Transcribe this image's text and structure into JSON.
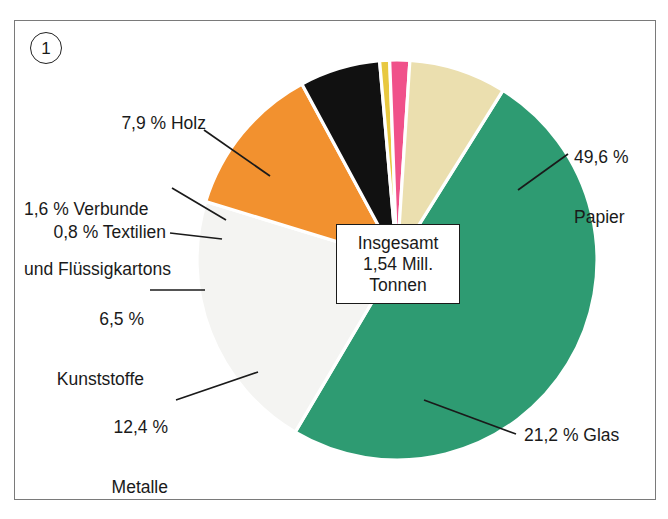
{
  "figure": {
    "marker_label": "1",
    "center_note": {
      "line1": "Insgesamt",
      "line2": "1,54 Mill.",
      "line3": "Tonnen"
    }
  },
  "colors": {
    "papier": "#2E9B72",
    "glas": "#F4F4F2",
    "metalle": "#F2912F",
    "kunststoffe": "#111111",
    "textilien": "#E8C840",
    "verbunde": "#F0518A",
    "holz": "#EBDFAF",
    "separator": "#FFFFFF",
    "leader_line": "#1A1A1A",
    "frame_border": "#7A7A7A",
    "text": "#1A1A1A"
  },
  "labels": {
    "holz": "7,9 % Holz",
    "verbunde_l1": "1,6 % Verbunde",
    "verbunde_l2": "und Flüssigkartons",
    "textilien": "0,8 % Textilien",
    "kunststoffe_l1": "6,5 %",
    "kunststoffe_l2": "Kunststoffe",
    "metalle_l1": "12,4 %",
    "metalle_l2": "Metalle",
    "papier_l1": "49,6 %",
    "papier_l2": "Papier",
    "glas": "21,2 % Glas"
  },
  "chart_data": {
    "type": "pie",
    "title": "Insgesamt 1,54 Mill. Tonnen",
    "unit": "%",
    "total_label": "1,54 Mill. Tonnen",
    "legend_position": "callout-labels",
    "categories": [
      "Papier",
      "Glas",
      "Metalle",
      "Kunststoffe",
      "Textilien",
      "Verbunde und Flüssigkartons",
      "Holz"
    ],
    "values": [
      49.6,
      21.2,
      12.4,
      6.5,
      0.8,
      1.6,
      7.9
    ],
    "slices": [
      {
        "name": "Papier",
        "value": 49.6,
        "display": "49,6 %",
        "color": "#2E9B72",
        "start_angle": -58.0,
        "end_angle": 120.6
      },
      {
        "name": "Glas",
        "value": 21.2,
        "display": "21,2 %",
        "color": "#F4F4F2",
        "start_angle": 120.6,
        "end_angle": 197.0
      },
      {
        "name": "Metalle",
        "value": 12.4,
        "display": "12,4 %",
        "color": "#F2912F",
        "start_angle": 197.0,
        "end_angle": 241.6
      },
      {
        "name": "Kunststoffe",
        "value": 6.5,
        "display": "6,5 %",
        "color": "#111111",
        "start_angle": 241.6,
        "end_angle": 265.0
      },
      {
        "name": "Textilien",
        "value": 0.8,
        "display": "0,8 %",
        "color": "#E8C840",
        "start_angle": 265.0,
        "end_angle": 267.9
      },
      {
        "name": "Verbunde und Flüssigkartons",
        "value": 1.6,
        "display": "1,6 %",
        "color": "#F0518A",
        "start_angle": 267.9,
        "end_angle": 273.7
      },
      {
        "name": "Holz",
        "value": 7.9,
        "display": "7,9 %",
        "color": "#EBDFAF",
        "start_angle": 273.7,
        "end_angle": 302.0
      }
    ]
  }
}
